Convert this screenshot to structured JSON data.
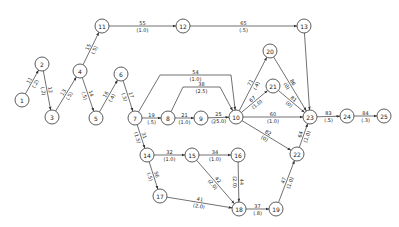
{
  "diagram": {
    "type": "network",
    "node_radius": 7,
    "nodes": [
      {
        "id": "1",
        "x": 22,
        "y": 100
      },
      {
        "id": "2",
        "x": 42,
        "y": 64
      },
      {
        "id": "3",
        "x": 52,
        "y": 117
      },
      {
        "id": "4",
        "x": 80,
        "y": 71
      },
      {
        "id": "5",
        "x": 96,
        "y": 118
      },
      {
        "id": "6",
        "x": 121,
        "y": 74
      },
      {
        "id": "7",
        "x": 135,
        "y": 118
      },
      {
        "id": "8",
        "x": 168,
        "y": 118
      },
      {
        "id": "9",
        "x": 201,
        "y": 118
      },
      {
        "id": "10",
        "x": 236,
        "y": 117
      },
      {
        "id": "11",
        "x": 102,
        "y": 26
      },
      {
        "id": "12",
        "x": 183,
        "y": 26
      },
      {
        "id": "13",
        "x": 304,
        "y": 26
      },
      {
        "id": "14",
        "x": 147,
        "y": 155
      },
      {
        "id": "15",
        "x": 192,
        "y": 155
      },
      {
        "id": "16",
        "x": 238,
        "y": 155
      },
      {
        "id": "17",
        "x": 160,
        "y": 196
      },
      {
        "id": "18",
        "x": 239,
        "y": 209
      },
      {
        "id": "19",
        "x": 276,
        "y": 209
      },
      {
        "id": "20",
        "x": 270,
        "y": 51
      },
      {
        "id": "21",
        "x": 273,
        "y": 86
      },
      {
        "id": "22",
        "x": 297,
        "y": 154
      },
      {
        "id": "23",
        "x": 310,
        "y": 117
      },
      {
        "id": "24",
        "x": 347,
        "y": 116
      },
      {
        "id": "25",
        "x": 384,
        "y": 116
      }
    ],
    "edges": [
      {
        "from": "1",
        "to": "2",
        "label": "11",
        "sublabel": "(.2)"
      },
      {
        "from": "2",
        "to": "3",
        "label": "12",
        "sublabel": "(.2)"
      },
      {
        "from": "3",
        "to": "4",
        "label": "13",
        "sublabel": "(.5)"
      },
      {
        "from": "4",
        "to": "5",
        "label": "14",
        "sublabel": "(.5)"
      },
      {
        "from": "4",
        "to": "11",
        "label": "15",
        "sublabel": "(.5)"
      },
      {
        "from": "5",
        "to": "6",
        "label": "16",
        "sublabel": "(.4)"
      },
      {
        "from": "6",
        "to": "7",
        "label": "17",
        "sublabel": "(.5)"
      },
      {
        "from": "11",
        "to": "12",
        "label": "55",
        "sublabel": "(1.0)"
      },
      {
        "from": "12",
        "to": "13",
        "label": "65",
        "sublabel": "(.5)"
      },
      {
        "from": "13",
        "to": "23",
        "label": "",
        "sublabel": ""
      },
      {
        "from": "7",
        "to": "8",
        "label": "19",
        "sublabel": "(.5)"
      },
      {
        "from": "7",
        "to": "10",
        "label": "54",
        "sublabel": "(1.0)",
        "via": [
          [
            160,
            75
          ],
          [
            231,
            75
          ]
        ]
      },
      {
        "from": "8",
        "to": "10",
        "label": "38",
        "sublabel": "(2.5)",
        "via": [
          [
            183,
            87
          ],
          [
            220,
            87
          ]
        ]
      },
      {
        "from": "8",
        "to": "9",
        "label": "21",
        "sublabel": "(1.0)"
      },
      {
        "from": "9",
        "to": "10",
        "label": "25",
        "sublabel": "(25.0)"
      },
      {
        "from": "10",
        "to": "20",
        "label": "71",
        "sublabel": "(.4)"
      },
      {
        "from": "10",
        "to": "21",
        "label": "67",
        "sublabel": "(1.0)"
      },
      {
        "from": "10",
        "to": "23",
        "label": "60",
        "sublabel": "(1.0)"
      },
      {
        "from": "10",
        "to": "22",
        "label": "82",
        "sublabel": "(0)"
      },
      {
        "from": "20",
        "to": "23",
        "label": "86",
        "sublabel": "(0)"
      },
      {
        "from": "21",
        "to": "23",
        "label": "81",
        "sublabel": "(0)"
      },
      {
        "from": "22",
        "to": "23",
        "label": "64",
        "sublabel": "(1.0)"
      },
      {
        "from": "23",
        "to": "24",
        "label": "83",
        "sublabel": "(.5)"
      },
      {
        "from": "24",
        "to": "25",
        "label": "84",
        "sublabel": "(.3)"
      },
      {
        "from": "7",
        "to": "14",
        "label": "31",
        "sublabel": "(1.5)"
      },
      {
        "from": "14",
        "to": "15",
        "label": "32",
        "sublabel": "(1.0)"
      },
      {
        "from": "14",
        "to": "17",
        "label": "56",
        "sublabel": "(.5)"
      },
      {
        "from": "15",
        "to": "16",
        "label": "34",
        "sublabel": "(1.0)"
      },
      {
        "from": "15",
        "to": "18",
        "label": "42",
        "sublabel": "(2.0)"
      },
      {
        "from": "16",
        "to": "18",
        "label": "44",
        "sublabel": "(2.0)"
      },
      {
        "from": "17",
        "to": "18",
        "label": "41",
        "sublabel": "(2.0)"
      },
      {
        "from": "18",
        "to": "19",
        "label": "37",
        "sublabel": "(.8)"
      },
      {
        "from": "19",
        "to": "22",
        "label": "47",
        "sublabel": "(1.0)"
      }
    ]
  }
}
